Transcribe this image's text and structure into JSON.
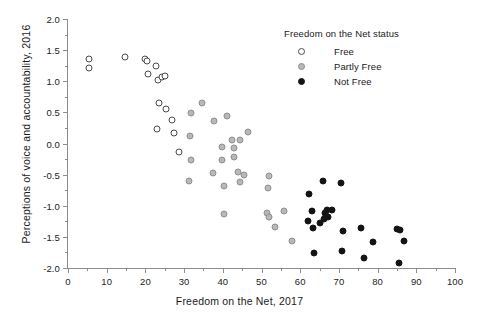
{
  "chart_data": {
    "type": "scatter",
    "title": "",
    "xlabel": "Freedom on the Net, 2017",
    "ylabel": "Perceptions of voice and accountability, 2016",
    "xlim": [
      0,
      100
    ],
    "ylim": [
      -2.0,
      2.0
    ],
    "xticks": [
      0,
      10,
      20,
      30,
      40,
      50,
      60,
      70,
      80,
      90,
      100
    ],
    "xtick_labels": [
      "0",
      "10",
      "20",
      "30",
      "40",
      "50",
      "60",
      "70",
      "80",
      "90",
      "100"
    ],
    "xminor_ticks": [
      5,
      15,
      25,
      35,
      45,
      55,
      65,
      75,
      85,
      95
    ],
    "yticks": [
      2.0,
      1.5,
      1.0,
      0.5,
      0.0,
      -0.5,
      -1.0,
      -1.5,
      -2.0
    ],
    "ytick_labels": [
      "2.0",
      "1.5",
      "1.0",
      "0.5",
      "0.0",
      "-0.5",
      "-1.0",
      "-1.5",
      "-2.0"
    ],
    "yminor_ticks": [
      1.75,
      1.25,
      0.75,
      0.25,
      -0.25,
      -0.75,
      -1.25,
      -1.75
    ],
    "grid": false,
    "legend_position": "top-right",
    "legend": {
      "title": "Freedom on the Net status",
      "entries": [
        {
          "name": "Free",
          "marker": "open-circle",
          "color": "#ffffff",
          "edge": "#4a4a4a"
        },
        {
          "name": "Partly Free",
          "marker": "gray-circle",
          "color": "#b8b8b8",
          "edge": "#8f8f8f"
        },
        {
          "name": "Not Free",
          "marker": "filled-circle",
          "color": "#141414",
          "edge": "#141414"
        }
      ]
    },
    "series": [
      {
        "name": "Free",
        "marker": "open-circle",
        "color": "#ffffff",
        "edge": "#4a4a4a",
        "points": [
          [
            5.4,
            1.35
          ],
          [
            5.4,
            1.22
          ],
          [
            14.6,
            1.39
          ],
          [
            19.8,
            1.35
          ],
          [
            20.4,
            1.33
          ],
          [
            20.8,
            1.12
          ],
          [
            22.8,
            1.25
          ],
          [
            23.2,
            1.02
          ],
          [
            24.3,
            1.07
          ],
          [
            25.0,
            1.09
          ],
          [
            23.6,
            0.65
          ],
          [
            25.2,
            0.56
          ],
          [
            23.0,
            0.24
          ],
          [
            27.0,
            0.38
          ],
          [
            27.3,
            0.17
          ],
          [
            28.7,
            -0.13
          ]
        ]
      },
      {
        "name": "Partly Free",
        "marker": "gray-circle",
        "color": "#b8b8b8",
        "edge": "#8f8f8f",
        "points": [
          [
            34.5,
            0.65
          ],
          [
            31.8,
            0.49
          ],
          [
            41.1,
            0.44
          ],
          [
            37.8,
            0.36
          ],
          [
            46.6,
            0.18
          ],
          [
            31.6,
            0.12
          ],
          [
            42.5,
            0.06
          ],
          [
            44.4,
            0.06
          ],
          [
            39.9,
            -0.06
          ],
          [
            42.8,
            -0.08
          ],
          [
            43.0,
            -0.22
          ],
          [
            39.9,
            -0.27
          ],
          [
            31.9,
            -0.27
          ],
          [
            44.0,
            -0.45
          ],
          [
            45.5,
            -0.5
          ],
          [
            37.5,
            -0.47
          ],
          [
            52.0,
            -0.53
          ],
          [
            31.2,
            -0.6
          ],
          [
            44.5,
            -0.62
          ],
          [
            40.3,
            -0.68
          ],
          [
            51.6,
            -0.72
          ],
          [
            55.8,
            -1.08
          ],
          [
            51.4,
            -1.11
          ],
          [
            51.9,
            -1.18
          ],
          [
            40.2,
            -1.14
          ],
          [
            53.4,
            -1.34
          ],
          [
            57.8,
            -1.57
          ]
        ]
      },
      {
        "name": "Not Free",
        "marker": "filled-circle",
        "color": "#141414",
        "edge": "#141414",
        "points": [
          [
            65.8,
            -0.6
          ],
          [
            70.6,
            -0.64
          ],
          [
            62.2,
            -0.81
          ],
          [
            63.0,
            -1.09
          ],
          [
            67.0,
            -1.07
          ],
          [
            68.3,
            -1.07
          ],
          [
            66.4,
            -1.11
          ],
          [
            66.7,
            -1.17
          ],
          [
            67.2,
            -1.18
          ],
          [
            66.2,
            -1.21
          ],
          [
            61.9,
            -1.25
          ],
          [
            65.0,
            -1.27
          ],
          [
            63.3,
            -1.35
          ],
          [
            71.0,
            -1.4
          ],
          [
            75.8,
            -1.35
          ],
          [
            78.9,
            -1.58
          ],
          [
            85.0,
            -1.37
          ],
          [
            85.8,
            -1.39
          ],
          [
            86.8,
            -1.56
          ],
          [
            63.5,
            -1.76
          ],
          [
            70.9,
            -1.73
          ],
          [
            76.6,
            -1.84
          ],
          [
            85.6,
            -1.92
          ]
        ]
      }
    ]
  }
}
